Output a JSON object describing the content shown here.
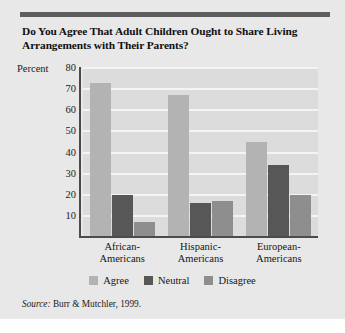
{
  "figure": {
    "title": "Do You Agree That Adult Children Ought to Share Living Arrangements with Their Parents?",
    "source_word": "Source:",
    "source_text": " Burr & Mutchler, 1999.",
    "y_axis_title": "Percent"
  },
  "chart_data": {
    "type": "bar",
    "title": "Do You Agree That Adult Children Ought to Share Living Arrangements with Their Parents?",
    "xlabel": "",
    "ylabel": "Percent",
    "ylim": [
      0,
      80
    ],
    "yticks": [
      10,
      20,
      30,
      40,
      50,
      60,
      70,
      80
    ],
    "grid": true,
    "legend_position": "bottom",
    "categories": [
      "African-Americans",
      "Hispanic-Americans",
      "European-Americans"
    ],
    "category_lines": [
      [
        "African-",
        "Americans"
      ],
      [
        "Hispanic-",
        "Americans"
      ],
      [
        "European-",
        "Americans"
      ]
    ],
    "series": [
      {
        "name": "Agree",
        "color": "#b3b3b3",
        "values": [
          73,
          67,
          45
        ]
      },
      {
        "name": "Neutral",
        "color": "#575757",
        "values": [
          20,
          16,
          34
        ]
      },
      {
        "name": "Disagree",
        "color": "#8e8e8e",
        "values": [
          7,
          17,
          20
        ]
      }
    ],
    "annotations": [
      "Source: Burr & Mutchler, 1999."
    ]
  },
  "colors": {
    "card_background": "#e8e8e8",
    "plot_background": "#dcdcdc",
    "gridline": "#f4f4f4",
    "axis": "#4b4b4b",
    "rule": "#5d5d5d",
    "text": "#161616"
  }
}
